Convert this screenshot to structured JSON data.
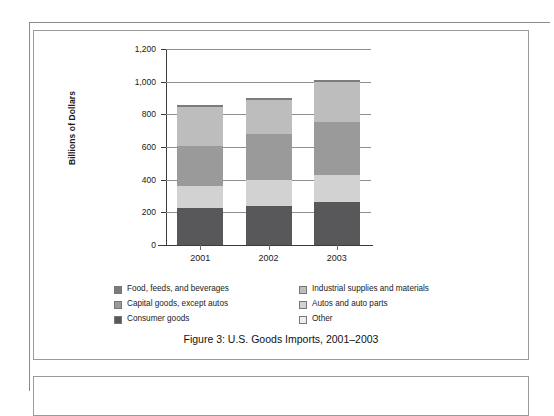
{
  "figure": {
    "caption": "Figure 3:  U.S. Goods Imports, 2001–2003"
  },
  "chart_data": {
    "type": "bar",
    "stacked": true,
    "title": "Figure 3:  U.S. Goods Imports, 2001–2003",
    "xlabel": "",
    "ylabel": "Billions of Dollars",
    "ylim": [
      0,
      1200
    ],
    "yticks": [
      0,
      200,
      400,
      600,
      800,
      1000,
      1200
    ],
    "ytick_labels": [
      "0",
      "200",
      "400",
      "600",
      "800",
      "1,000",
      "1,200"
    ],
    "grid": true,
    "legend_position": "below-plot",
    "categories": [
      "2001",
      "2002",
      "2003"
    ],
    "series": [
      {
        "name": "Consumer goods",
        "color": "#58585a",
        "values": [
          225,
          240,
          265
        ]
      },
      {
        "name": "Autos and auto parts",
        "color": "#d2d2d2",
        "values": [
          135,
          155,
          165
        ]
      },
      {
        "name": "Capital goods, except autos",
        "color": "#9a9a9a",
        "values": [
          245,
          285,
          325
        ]
      },
      {
        "name": "Industrial supplies and materials",
        "color": "#bdbdbd",
        "values": [
          240,
          205,
          245
        ]
      },
      {
        "name": "Food, feeds, and beverages",
        "color": "#7b7b7d",
        "values": [
          15,
          15,
          10
        ]
      },
      {
        "name": "Other",
        "color": "#eeeeee",
        "values": [
          0,
          0,
          0
        ]
      }
    ],
    "totals": [
      860,
      900,
      1010
    ]
  },
  "axes": {
    "y_title": "Billions of Dollars",
    "y_ticks": [
      {
        "label": "1,200",
        "value": 1200
      },
      {
        "label": "1,000",
        "value": 1000
      },
      {
        "label": "800",
        "value": 800
      },
      {
        "label": "600",
        "value": 600
      },
      {
        "label": "400",
        "value": 400
      },
      {
        "label": "200",
        "value": 200
      },
      {
        "label": "0",
        "value": 0
      }
    ],
    "x_ticks": [
      {
        "label": "2001"
      },
      {
        "label": "2002"
      },
      {
        "label": "2003"
      }
    ]
  },
  "legend": {
    "left_column": [
      {
        "label": "Food, feeds, and beverages",
        "color": "#7b7b7d"
      },
      {
        "label": "Capital goods, except autos",
        "color": "#9a9a9a"
      },
      {
        "label": "Consumer goods",
        "color": "#58585a"
      }
    ],
    "right_column": [
      {
        "label": "Industrial supplies and materials",
        "color": "#bdbdbd"
      },
      {
        "label": "Autos and auto parts",
        "color": "#d2d2d2"
      },
      {
        "label": "Other",
        "color": "#eeeeee"
      }
    ]
  }
}
